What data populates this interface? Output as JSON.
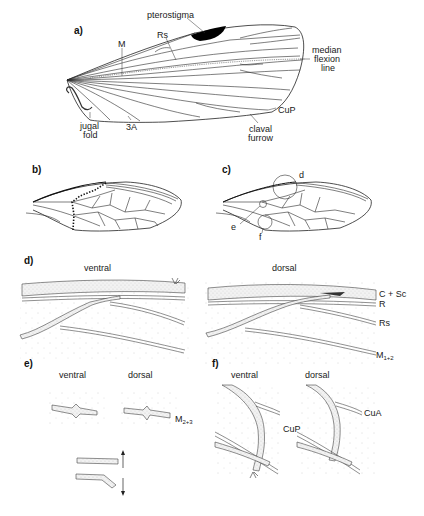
{
  "figure": {
    "panels": {
      "a": {
        "label": "a)",
        "annotations": {
          "pterostigma": "pterostigma",
          "rs": "Rs",
          "m": "M",
          "median_flexion_1": "median",
          "median_flexion_2": "flexion",
          "median_flexion_3": "line",
          "cup": "CuP",
          "claval_1": "claval",
          "claval_2": "furrow",
          "jugal_1": "jugal",
          "jugal_2": "fold",
          "a3": "3A"
        }
      },
      "b": {
        "label": "b)"
      },
      "c": {
        "label": "c)",
        "callouts": {
          "d": "d",
          "e": "e",
          "f": "f"
        }
      },
      "d": {
        "label": "d)",
        "view_left": "ventral",
        "view_right": "dorsal",
        "veins": {
          "c_sc": "C + Sc",
          "r": "R",
          "rs": "Rs",
          "m12_base": "M",
          "m12_sub": "1+2"
        }
      },
      "e": {
        "label": "e)",
        "view_left": "ventral",
        "view_right": "dorsal",
        "veins": {
          "m23_base": "M",
          "m23_sub": "2+3"
        },
        "arrows": {
          "up": "↑",
          "down": "↓"
        }
      },
      "f": {
        "label": "f)",
        "view_left": "ventral",
        "view_right": "dorsal",
        "veins": {
          "cua": "CuA",
          "cup": "CuP"
        }
      }
    }
  }
}
